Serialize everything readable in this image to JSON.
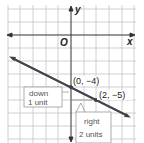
{
  "axes": {
    "x_label": "x",
    "y_label": "y",
    "origin_label": "O"
  },
  "points": [
    {
      "label": "(0, −4)",
      "x": 0,
      "y": -4
    },
    {
      "label": "(2, −5)",
      "x": 2,
      "y": -5
    }
  ],
  "annotations": {
    "down": [
      "down",
      "1 unit"
    ],
    "right": [
      "right",
      "2 units"
    ]
  },
  "colors": {
    "grid": "#bdbdbd",
    "axis": "#333333",
    "line": "#3a3f4a",
    "text": "#222222",
    "callout": "#888888"
  },
  "line": {
    "slope": -0.5,
    "intercept": -4
  }
}
